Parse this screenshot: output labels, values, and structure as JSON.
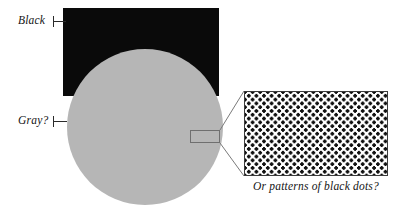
{
  "figure": {
    "background_color": "#ffffff"
  },
  "shapes": {
    "rectangle": {
      "name": "black-rectangle",
      "fill": "#0a0a0a",
      "x": 63,
      "y": 8,
      "width": 156,
      "height": 88
    },
    "circle": {
      "name": "gray-circle",
      "fill": "#b6b6b6",
      "cx": 145,
      "cy": 127,
      "r": 78
    },
    "callout_box": {
      "name": "callout-selection-box",
      "stroke": "#6f6f6f",
      "x": 190,
      "y": 130,
      "width": 30,
      "height": 13
    }
  },
  "labels": {
    "black": "Black",
    "gray": "Gray?"
  },
  "magnifier": {
    "caption": "Or patterns of black dots?",
    "border_color": "#3c3c3c",
    "dot_color": "#111111",
    "background_color": "#ffffff",
    "dot_spacing_px": 7.6,
    "dot_radius_px": 1.65,
    "x": 244,
    "y": 91,
    "width": 144,
    "height": 85
  },
  "connectors": [
    {
      "name": "upper-connector",
      "x1": 220,
      "y1": 130,
      "x2": 244,
      "y2": 91
    },
    {
      "name": "lower-connector",
      "x1": 220,
      "y1": 143,
      "x2": 244,
      "y2": 176
    }
  ]
}
